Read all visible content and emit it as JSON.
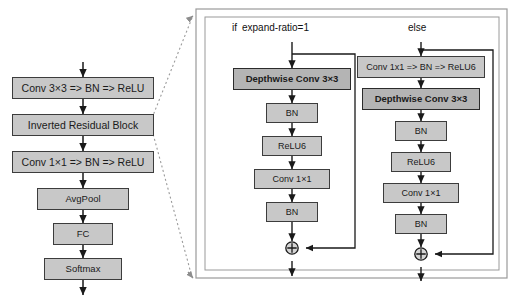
{
  "diagram": {
    "colors": {
      "box_fill": "#c8c8c8",
      "box_fill_emphasis": "#b4b4b4",
      "box_stroke": "#3c3c3c",
      "panel_stroke": "#9a9a9a",
      "arrow": "#1a1a1a",
      "dashed_guide": "#9a9a9a",
      "background": "#ffffff"
    },
    "main_pipeline": {
      "name": "main-network-pipeline",
      "nodes": [
        {
          "id": "conv3x3",
          "label": "Conv 3×3 => BN => ReLU",
          "style": "wide"
        },
        {
          "id": "irb",
          "label": "Inverted Residual Block",
          "style": "wide"
        },
        {
          "id": "conv1x1",
          "label": "Conv 1×1 => BN => ReLU",
          "style": "wide"
        },
        {
          "id": "avgpool",
          "label": "AvgPool",
          "style": "narrow"
        },
        {
          "id": "fc",
          "label": "FC",
          "style": "narrow"
        },
        {
          "id": "softmax",
          "label": "Softmax",
          "style": "narrow"
        }
      ]
    },
    "detail_panel": {
      "name": "inverted-residual-detail-panel",
      "branches": [
        {
          "id": "branch-expand-ratio-1",
          "condition_keyword": "if",
          "condition_text": "expand-ratio=1",
          "nodes": [
            {
              "id": "dw1",
              "label": "Depthwise Conv 3×3",
              "emphasis": true
            },
            {
              "id": "bn1",
              "label": "BN",
              "emphasis": false
            },
            {
              "id": "act1",
              "label": "ReLU6",
              "emphasis": false
            },
            {
              "id": "pw1",
              "label": "Conv 1×1",
              "emphasis": false
            },
            {
              "id": "bn2",
              "label": "BN",
              "emphasis": false
            }
          ],
          "residual_add": "⊕",
          "has_skip_connection": true
        },
        {
          "id": "branch-else",
          "condition_keyword": "else",
          "condition_text": "",
          "nodes": [
            {
              "id": "pwe",
              "label": "Conv 1x1 => BN => ReLU6",
              "emphasis": false
            },
            {
              "id": "dwe",
              "label": "Depthwise Conv 3×3",
              "emphasis": true
            },
            {
              "id": "bne1",
              "label": "BN",
              "emphasis": false
            },
            {
              "id": "acte",
              "label": "ReLU6",
              "emphasis": false
            },
            {
              "id": "pwe2",
              "label": "Conv 1×1",
              "emphasis": false
            },
            {
              "id": "bne2",
              "label": "BN",
              "emphasis": false
            }
          ],
          "residual_add": "⊕",
          "has_skip_connection": true
        }
      ]
    }
  }
}
